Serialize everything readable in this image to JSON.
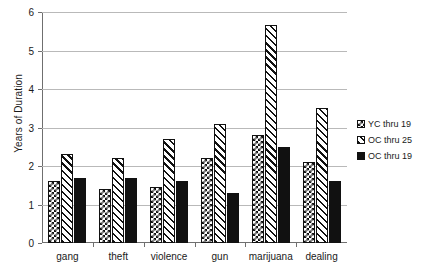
{
  "chart_data": {
    "type": "bar",
    "title": "",
    "xlabel": "",
    "ylabel": "Years of Duration",
    "categories": [
      "gang",
      "theft",
      "violence",
      "gun",
      "marijuana",
      "dealing"
    ],
    "series": [
      {
        "name": "YC thru 19",
        "pattern": "checkerboard",
        "color": "#111111",
        "values": [
          1.6,
          1.4,
          1.45,
          2.2,
          2.8,
          2.1
        ]
      },
      {
        "name": "OC thru 25",
        "pattern": "diagonal-hatch",
        "color": "#111111",
        "values": [
          2.3,
          2.2,
          2.7,
          3.1,
          5.65,
          3.5
        ]
      },
      {
        "name": "OC thru 19",
        "pattern": "solid",
        "color": "#111111",
        "values": [
          1.7,
          1.7,
          1.6,
          1.3,
          2.5,
          1.6
        ]
      }
    ],
    "ylim": [
      0,
      6
    ],
    "yticks": [
      0,
      1,
      2,
      3,
      4,
      5,
      6
    ],
    "ytick_labels": [
      "0",
      "1",
      "2",
      "3",
      "4",
      "5",
      "6"
    ],
    "grid": true,
    "legend_position": "right"
  },
  "legend": {
    "items": [
      {
        "label": "YC thru 19",
        "pattern": "checkerboard"
      },
      {
        "label": "OC thru 25",
        "pattern": "diagonal-hatch"
      },
      {
        "label": "OC thru 19",
        "pattern": "solid"
      }
    ]
  },
  "axis": {
    "y_title": "Years of Duration"
  }
}
